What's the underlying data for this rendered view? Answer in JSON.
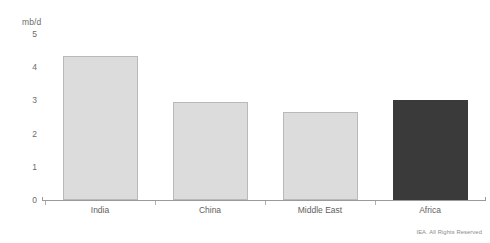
{
  "chart_data": {
    "type": "bar",
    "title": "",
    "subtitle": "",
    "xlabel": "",
    "ylabel": "mb/d",
    "unit_label": "mb/d",
    "categories": [
      "India",
      "China",
      "Middle East",
      "Africa"
    ],
    "values": [
      4.35,
      2.95,
      2.65,
      3.0
    ],
    "series": [
      {
        "name": "Oil demand growth",
        "values": [
          4.35,
          2.95,
          2.65,
          3.0
        ]
      }
    ],
    "ylim": [
      0,
      5
    ],
    "yticks": [
      0,
      1,
      2,
      3,
      4,
      5
    ],
    "ytick_labels": [
      "0",
      "1",
      "2",
      "3",
      "4",
      "5"
    ],
    "grid": false,
    "legend": false,
    "legend_position": "none",
    "bar_colors": [
      "#dcdcdc",
      "#dcdcdc",
      "#dcdcdc",
      "#3a3a3a"
    ],
    "highlight_category": "Africa",
    "colors": {
      "bar_light_fill": "#dcdcdc",
      "bar_light_border": "#b9b9b9",
      "bar_dark_fill": "#3a3a3a",
      "axis": "#9a9a9a",
      "text": "#5f5f5f",
      "background": "#ffffff"
    }
  },
  "footer": {
    "copyright": "IEA. All Rights Reserved"
  }
}
